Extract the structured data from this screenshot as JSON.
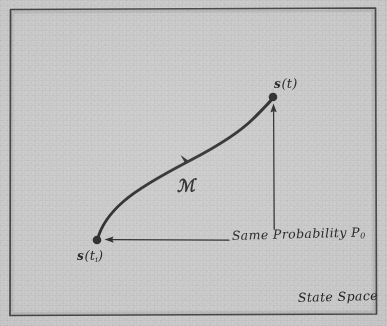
{
  "figure": {
    "kind": "hand-drawn-diagram",
    "caption_region": "State Space",
    "paper_color": "#cbcbcb",
    "ink_color": "#2a2a2b",
    "border": {
      "name": "frame",
      "color": "#4a4a4c"
    }
  },
  "labels": {
    "state_final": {
      "symbol": "s",
      "arg": "(t)",
      "sub": ""
    },
    "state_initial": {
      "symbol": "s",
      "arg": "(t",
      "sub": "i",
      "close": ")"
    },
    "operator": "ℳ",
    "probability": "Same Probability P",
    "probability_sub": "0",
    "space": "State Space"
  },
  "text": {
    "state_final_full": "s(t)",
    "state_initial_full": "s(tᵢ)",
    "operator_full": "ℳ",
    "probability_full": "Same Probability P",
    "probability_subscript": "0",
    "space_full": "State Space"
  },
  "geometry": {
    "trajectory": {
      "name": "evolution-curve",
      "start": [
        97,
        240
      ],
      "end": [
        273,
        98
      ],
      "arrow_at": [
        187,
        162
      ]
    },
    "dots": [
      {
        "name": "initial-state-dot",
        "cx": 97,
        "cy": 240,
        "r": 4.2
      },
      {
        "name": "final-state-dot",
        "cx": 273,
        "cy": 97,
        "r": 4.2
      }
    ],
    "leader_horizontal": {
      "name": "probability-leader-left",
      "from": [
        228,
        240
      ],
      "to": [
        110,
        240
      ]
    },
    "leader_vertical": {
      "name": "probability-leader-up",
      "from": [
        274,
        228
      ],
      "to": [
        274,
        104
      ]
    }
  }
}
